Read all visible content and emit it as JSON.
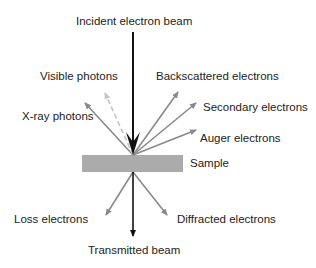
{
  "diagram": {
    "colors": {
      "beam": "#111111",
      "emission": "#8a8a8a",
      "visible": "#c4c4c4",
      "sample": "#ababab",
      "text": "#222222"
    },
    "labels": {
      "incident": "Incident electron beam",
      "visible_photons": "Visible photons",
      "backscattered": "Backscattered electrons",
      "xray": "X-ray photons",
      "secondary": "Secondary electrons",
      "auger": "Auger electrons",
      "sample": "Sample",
      "loss": "Loss electrons",
      "diffracted": "Diffracted electrons",
      "transmitted": "Transmitted beam"
    }
  }
}
